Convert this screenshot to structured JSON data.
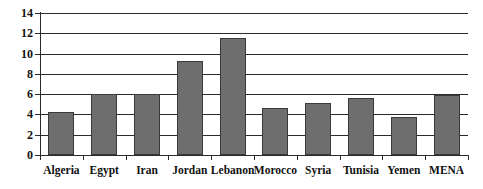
{
  "chart_data": {
    "type": "bar",
    "title": "",
    "subtitle": "",
    "xlabel": "",
    "ylabel": "",
    "categories": [
      "Algeria",
      "Egypt",
      "Iran",
      "Jordan",
      "Lebanon",
      "Morocco",
      "Syria",
      "Tunisia",
      "Yemen",
      "MENA"
    ],
    "values": [
      4.25,
      6.0,
      6.0,
      9.3,
      11.5,
      4.6,
      5.1,
      5.6,
      3.75,
      5.95
    ],
    "ylim": [
      0,
      14
    ],
    "ytick_values": [
      0,
      2,
      4,
      6,
      8,
      10,
      12,
      14
    ],
    "ytick_labels": [
      "0",
      "2",
      "4",
      "6",
      "8",
      "10",
      "12",
      "14"
    ],
    "grid": true,
    "grid_axis": "y",
    "legend": false,
    "legend_position": "none",
    "bar_color": "#6e6e6e",
    "bar_edge_color": "#3a3a3a",
    "axis_color": "#2b2b2b",
    "background_color": "#ffffff",
    "series": [
      {
        "name": "",
        "values": [
          4.25,
          6.0,
          6.0,
          9.3,
          11.5,
          4.6,
          5.1,
          5.6,
          3.75,
          5.95
        ]
      }
    ],
    "annotations": []
  }
}
